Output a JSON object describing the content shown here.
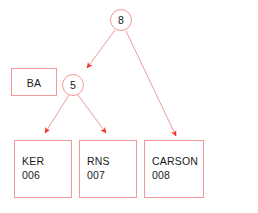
{
  "diagram": {
    "type": "tree-diagram",
    "background_color": "#ffffff",
    "stroke_color": "#ef9a97",
    "arrow_color": "#f4332a",
    "text_color": "#1a1a1a",
    "root": {
      "id": "node-8",
      "shape": "circle",
      "label": "8"
    },
    "internal": {
      "id": "node-5",
      "shape": "circle",
      "label": "5"
    },
    "detached_box": {
      "id": "box-ba",
      "shape": "rectangle",
      "label": "BA"
    },
    "leaves": [
      {
        "id": "box-ker",
        "shape": "rectangle",
        "name": "KER",
        "code": "006"
      },
      {
        "id": "box-rns",
        "shape": "rectangle",
        "name": "RNS",
        "code": "007"
      },
      {
        "id": "box-carson",
        "shape": "rectangle",
        "name": "CARSON",
        "code": "008"
      }
    ],
    "edges": [
      {
        "from": "8",
        "to": "5",
        "arrow": "end"
      },
      {
        "from": "8",
        "to": "CARSON",
        "arrow": "end"
      },
      {
        "from": "5",
        "to": "KER",
        "arrow": "end"
      },
      {
        "from": "5",
        "to": "RNS",
        "arrow": "end"
      }
    ]
  }
}
